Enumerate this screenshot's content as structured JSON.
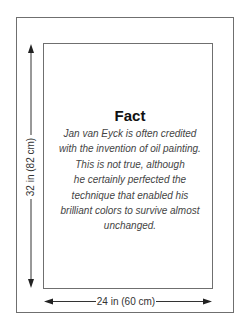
{
  "fact": {
    "title": "Fact",
    "lines": [
      "Jan van Eyck is often credited",
      "with the invention of oil painting.",
      "This is not true, although",
      "he certainly perfected the",
      "technique that enabled his",
      "brilliant colors to survive almost",
      "unchanged."
    ]
  },
  "dimensions": {
    "height_label": "32 in (82 cm)",
    "width_label": "24 in (60 cm)"
  },
  "colors": {
    "frame_stroke": "#6f6f6f",
    "arrow": "#222222",
    "title_text": "#111111",
    "body_text": "#444444"
  }
}
